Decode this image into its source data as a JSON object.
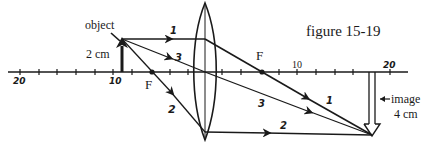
{
  "figure": {
    "caption": "figure 15-19",
    "type": "thin converging lens ray diagram"
  },
  "axis": {
    "tick_labels": {
      "left_20": "20",
      "left_10": "10",
      "right_10": "10",
      "right_20": "20"
    },
    "units": "cm",
    "tick_spacing_cm": 2
  },
  "lens": {
    "type": "converging (convex)",
    "focal_length_cm": 6
  },
  "focal_points": {
    "left_label": "F",
    "right_label": "F"
  },
  "object": {
    "label": "object",
    "height_label": "2 cm",
    "distance_cm": 9
  },
  "image": {
    "label": "image",
    "height_label": "4 cm",
    "distance_cm": 18,
    "orientation": "inverted"
  },
  "rays": [
    {
      "id": "1",
      "label": "1",
      "description": "parallel to axis, refracts through far focal point"
    },
    {
      "id": "2",
      "label": "2",
      "description": "through near focal point, exits parallel to axis"
    },
    {
      "id": "3",
      "label": "3",
      "description": "through lens center, undeviated"
    }
  ],
  "colors": {
    "ink": "#1a1a1a",
    "background": "#ffffff"
  }
}
